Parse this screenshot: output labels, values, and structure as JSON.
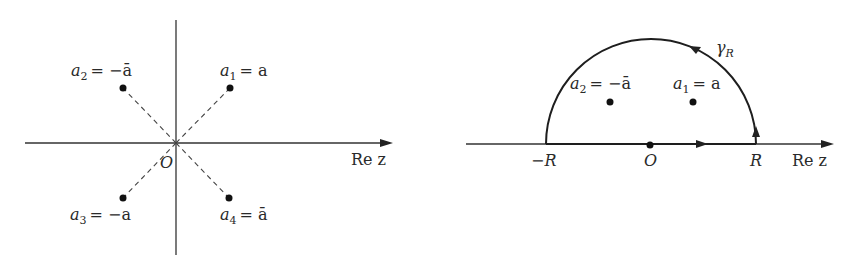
{
  "figures": [
    {
      "name": "pole-locations",
      "axis_label": "Re z",
      "origin_label": "O",
      "points": [
        {
          "id": "a1",
          "label_var": "a",
          "label_sub": "1",
          "label_rhs": "= a",
          "x": 230,
          "y": 88
        },
        {
          "id": "a2",
          "label_var": "a",
          "label_sub": "2",
          "label_rhs": "= −ā",
          "x": 123,
          "y": 88
        },
        {
          "id": "a3",
          "label_var": "a",
          "label_sub": "3",
          "label_rhs": "= −a",
          "x": 123,
          "y": 198
        },
        {
          "id": "a4",
          "label_var": "a",
          "label_sub": "4",
          "label_rhs": "= ā",
          "x": 229,
          "y": 198
        }
      ]
    },
    {
      "name": "semicircle-contour",
      "axis_label": "Re z",
      "origin_label": "O",
      "left_endpoint_label": "−R",
      "right_endpoint_label": "R",
      "arc_label_var": "γ",
      "arc_label_sub": "R",
      "points": [
        {
          "id": "a2",
          "label_var": "a",
          "label_sub": "2",
          "label_rhs": "= −ā",
          "x": 610,
          "y": 102
        },
        {
          "id": "a1",
          "label_var": "a",
          "label_sub": "1",
          "label_rhs": "= a",
          "x": 693,
          "y": 102
        }
      ]
    }
  ],
  "colors": {
    "background": "#ffffff",
    "ink": "#222222"
  }
}
